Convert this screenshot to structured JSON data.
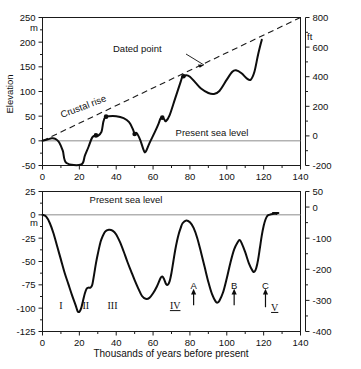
{
  "figure": {
    "background_color": "#ffffff",
    "ink_color": "#0d0d0d",
    "sealevel_color": "#8c8c8c"
  },
  "chart_data": [
    {
      "type": "line",
      "id": "upper-panel",
      "title": "",
      "xlabel": "",
      "ylabel": "Elevation",
      "y_unit_left": "m",
      "y_unit_right": "ft",
      "xlim": [
        0,
        140
      ],
      "ylim": [
        -50,
        250
      ],
      "ylim_right": [
        -200,
        800
      ],
      "grid": false,
      "legend": "none",
      "xticks": [
        0,
        20,
        40,
        60,
        80,
        100,
        120,
        140
      ],
      "xticklabels": [
        "0",
        "20",
        "40",
        "60",
        "80",
        "100",
        "120",
        "140"
      ],
      "yticks_left": [
        -50,
        0,
        50,
        100,
        150,
        200,
        250
      ],
      "yticklabels_left": [
        "-50",
        "0",
        "50",
        "100",
        "150",
        "200",
        "250"
      ],
      "yticks_right": [
        -200,
        0,
        200,
        400,
        600,
        800
      ],
      "yticklabels_right": [
        "-200",
        "0",
        "200",
        "400",
        "600",
        "800"
      ],
      "annotations": [
        {
          "text": "Dated point",
          "x": 52,
          "y": 172,
          "kind": "callout"
        },
        {
          "text": "Crustal rise",
          "x": 33,
          "y": 62,
          "kind": "rotated-label",
          "rotation": -20
        },
        {
          "text": "Present sea level",
          "x": 92,
          "y": 22,
          "kind": "label"
        }
      ],
      "series": [
        {
          "name": "Emerged reef terrace elevation",
          "style": "solid",
          "points": [
            [
              0,
              0
            ],
            [
              3,
              3
            ],
            [
              5,
              5
            ],
            [
              7,
              4
            ],
            [
              9,
              -3
            ],
            [
              11,
              -20
            ],
            [
              13,
              -45
            ],
            [
              21,
              -48
            ],
            [
              23,
              -30
            ],
            [
              25,
              -12
            ],
            [
              27,
              7
            ],
            [
              29,
              11
            ],
            [
              30,
              10
            ],
            [
              32,
              18
            ],
            [
              33,
              38
            ],
            [
              34,
              48
            ],
            [
              36,
              50
            ],
            [
              40,
              50
            ],
            [
              44,
              46
            ],
            [
              47,
              38
            ],
            [
              49,
              24
            ],
            [
              50,
              14
            ],
            [
              51,
              16
            ],
            [
              53,
              2
            ],
            [
              55,
              -20
            ],
            [
              56,
              -22
            ],
            [
              58,
              -5
            ],
            [
              61,
              18
            ],
            [
              63,
              35
            ],
            [
              64,
              45
            ],
            [
              65,
              47
            ],
            [
              66,
              44
            ],
            [
              67,
              40
            ],
            [
              69,
              52
            ],
            [
              72,
              86
            ],
            [
              75,
              120
            ],
            [
              76,
              130
            ],
            [
              78,
              133
            ],
            [
              80,
              130
            ],
            [
              83,
              118
            ],
            [
              86,
              106
            ],
            [
              90,
              97
            ],
            [
              93,
              95
            ],
            [
              96,
              101
            ],
            [
              100,
              124
            ],
            [
              103,
              140
            ],
            [
              105,
              143
            ],
            [
              108,
              137
            ],
            [
              111,
              126
            ],
            [
              113,
              124
            ],
            [
              115,
              140
            ],
            [
              117,
              175
            ],
            [
              119,
              205
            ]
          ]
        },
        {
          "name": "Crustal rise",
          "style": "dashed",
          "points": [
            [
              0,
              0
            ],
            [
              140,
              250
            ]
          ]
        }
      ],
      "dated_points": [
        {
          "x": 29,
          "y": 11
        },
        {
          "x": 34.5,
          "y": 49
        },
        {
          "x": 50,
          "y": 14
        },
        {
          "x": 65,
          "y": 47
        },
        {
          "x": 76.5,
          "y": 131
        }
      ]
    },
    {
      "type": "line",
      "id": "lower-panel",
      "title": "",
      "xlabel": "Thousands of years before present",
      "ylabel": "",
      "y_unit_left": "m",
      "y_unit_right": "",
      "xlim": [
        0,
        140
      ],
      "ylim": [
        -125,
        25
      ],
      "ylim_right": [
        -400,
        50
      ],
      "grid": false,
      "legend": "none",
      "xticks": [
        0,
        20,
        40,
        60,
        80,
        100,
        120,
        140
      ],
      "xticklabels": [
        "0",
        "20",
        "40",
        "60",
        "80",
        "100",
        "120",
        "140"
      ],
      "yticks_left": [
        -125,
        -100,
        -75,
        -50,
        -25,
        0,
        25
      ],
      "yticklabels_left": [
        "-125",
        "-100",
        "-75",
        "-50",
        "-25",
        "0",
        "25"
      ],
      "yticks_right": [
        -400,
        -300,
        -200,
        -100,
        0,
        50
      ],
      "yticklabels_right": [
        "-400",
        "-300",
        "-200",
        "-100",
        "0",
        "50"
      ],
      "annotations": [
        {
          "text": "Present sea level",
          "x": 38,
          "y": 3,
          "kind": "label"
        }
      ],
      "stage_labels": [
        {
          "text": "I",
          "x": 10,
          "y": -101,
          "underlined": false
        },
        {
          "text": "II",
          "x": 23.5,
          "y": -101,
          "underlined": false
        },
        {
          "text": "III",
          "x": 38,
          "y": -101,
          "underlined": false
        },
        {
          "text": "IV",
          "x": 72,
          "y": -101,
          "underlined": true
        },
        {
          "text": "V",
          "x": 126,
          "y": -103,
          "underlined": true
        }
      ],
      "event_markers": [
        {
          "label": "A",
          "x": 82,
          "y_label": -79,
          "arrow_from": -97,
          "arrow_to": -84
        },
        {
          "label": "B",
          "x": 104,
          "y_label": -79,
          "arrow_from": -97,
          "arrow_to": -84
        },
        {
          "label": "C",
          "x": 121,
          "y_label": -79,
          "arrow_from": -99,
          "arrow_to": -84
        }
      ],
      "series": [
        {
          "name": "Sea level relative to present",
          "style": "solid",
          "points": [
            [
              0,
              0
            ],
            [
              2,
              -2
            ],
            [
              4,
              -9
            ],
            [
              6,
              -20
            ],
            [
              8,
              -34
            ],
            [
              10,
              -48
            ],
            [
              12,
              -62
            ],
            [
              14,
              -74
            ],
            [
              16,
              -86
            ],
            [
              18,
              -97
            ],
            [
              19,
              -103
            ],
            [
              20,
              -104
            ],
            [
              21,
              -100
            ],
            [
              22,
              -92
            ],
            [
              23,
              -84
            ],
            [
              24,
              -79
            ],
            [
              25,
              -78
            ],
            [
              26,
              -78
            ],
            [
              27,
              -75
            ],
            [
              28,
              -64
            ],
            [
              29,
              -52
            ],
            [
              30,
              -42
            ],
            [
              31,
              -33
            ],
            [
              32,
              -26
            ],
            [
              34,
              -18
            ],
            [
              36,
              -16
            ],
            [
              38,
              -17
            ],
            [
              40,
              -21
            ],
            [
              42,
              -29
            ],
            [
              44,
              -39
            ],
            [
              46,
              -50
            ],
            [
              48,
              -60
            ],
            [
              50,
              -70
            ],
            [
              52,
              -79
            ],
            [
              54,
              -87
            ],
            [
              56,
              -90
            ],
            [
              58,
              -89
            ],
            [
              60,
              -84
            ],
            [
              62,
              -77
            ],
            [
              64,
              -68
            ],
            [
              65,
              -66
            ],
            [
              66,
              -69
            ],
            [
              67,
              -74
            ],
            [
              68,
              -75
            ],
            [
              69,
              -71
            ],
            [
              70,
              -62
            ],
            [
              71,
              -50
            ],
            [
              72,
              -38
            ],
            [
              73,
              -28
            ],
            [
              74,
              -20
            ],
            [
              75,
              -14
            ],
            [
              76,
              -9
            ],
            [
              78,
              -6
            ],
            [
              80,
              -8
            ],
            [
              82,
              -14
            ],
            [
              84,
              -25
            ],
            [
              86,
              -40
            ],
            [
              88,
              -56
            ],
            [
              90,
              -72
            ],
            [
              92,
              -85
            ],
            [
              94,
              -93
            ],
            [
              95,
              -94
            ],
            [
              96,
              -92
            ],
            [
              98,
              -83
            ],
            [
              100,
              -68
            ],
            [
              102,
              -51
            ],
            [
              104,
              -37
            ],
            [
              106,
              -29
            ],
            [
              107,
              -27
            ],
            [
              108,
              -30
            ],
            [
              110,
              -40
            ],
            [
              112,
              -52
            ],
            [
              114,
              -60
            ],
            [
              115,
              -61
            ],
            [
              116,
              -57
            ],
            [
              117,
              -48
            ],
            [
              118,
              -35
            ],
            [
              119,
              -22
            ],
            [
              120,
              -12
            ],
            [
              121,
              -5
            ],
            [
              122,
              -1
            ],
            [
              123,
              0
            ],
            [
              125,
              1
            ],
            [
              127,
              1
            ]
          ]
        },
        {
          "name": "Terminal segment",
          "style": "solid",
          "points": [
            [
              125,
              2
            ],
            [
              128,
              2
            ]
          ]
        }
      ]
    }
  ]
}
